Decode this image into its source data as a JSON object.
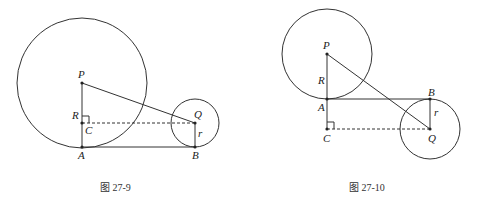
{
  "figures": [
    {
      "caption": "图 27-9",
      "labels": {
        "P": "P",
        "R": "R",
        "C": "C",
        "A": "A",
        "Q": "Q",
        "B": "B",
        "r": "r"
      }
    },
    {
      "caption": "图 27-10",
      "labels": {
        "P": "P",
        "R": "R",
        "A": "A",
        "C": "C",
        "B": "B",
        "Q": "Q",
        "r": "r"
      }
    }
  ]
}
